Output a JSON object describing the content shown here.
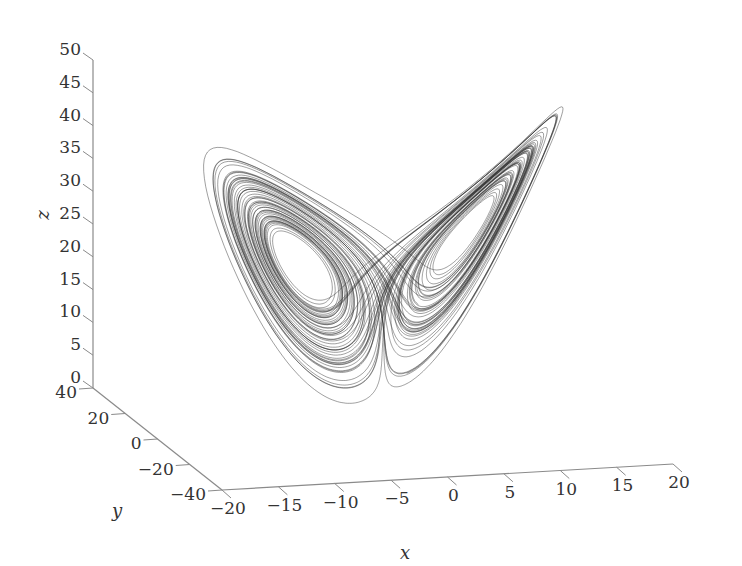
{
  "chart_data": {
    "type": "line",
    "subtype": "3d-trajectory",
    "title": "",
    "xlabel": "x",
    "ylabel": "y",
    "zlabel": "z",
    "xlim": [
      -20,
      20
    ],
    "ylim": [
      -40,
      40
    ],
    "zlim": [
      0,
      50
    ],
    "x_ticks": [
      "-20",
      "-15",
      "-10",
      "-5",
      "0",
      "5",
      "10",
      "15",
      "20"
    ],
    "y_ticks": [
      "40",
      "20",
      "0",
      "-20",
      "-40"
    ],
    "z_ticks": [
      "0",
      "5",
      "10",
      "15",
      "20",
      "25",
      "30",
      "35",
      "40",
      "45",
      "50"
    ],
    "grid": false,
    "legend": null,
    "series": [
      {
        "name": "trajectory",
        "color": "#2b2b2b",
        "parameters": {
          "sigma": 10,
          "rho": 28,
          "beta": 2.6667
        },
        "fixed_points_approx": [
          {
            "x": -8.5,
            "y": -8.5,
            "z": 27
          },
          {
            "x": 8.5,
            "y": 8.5,
            "z": 27
          }
        ]
      }
    ]
  },
  "colors": {
    "axis": "#8a8a8a",
    "line": "#2b2b2b",
    "text": "#333333",
    "background": "#ffffff"
  }
}
